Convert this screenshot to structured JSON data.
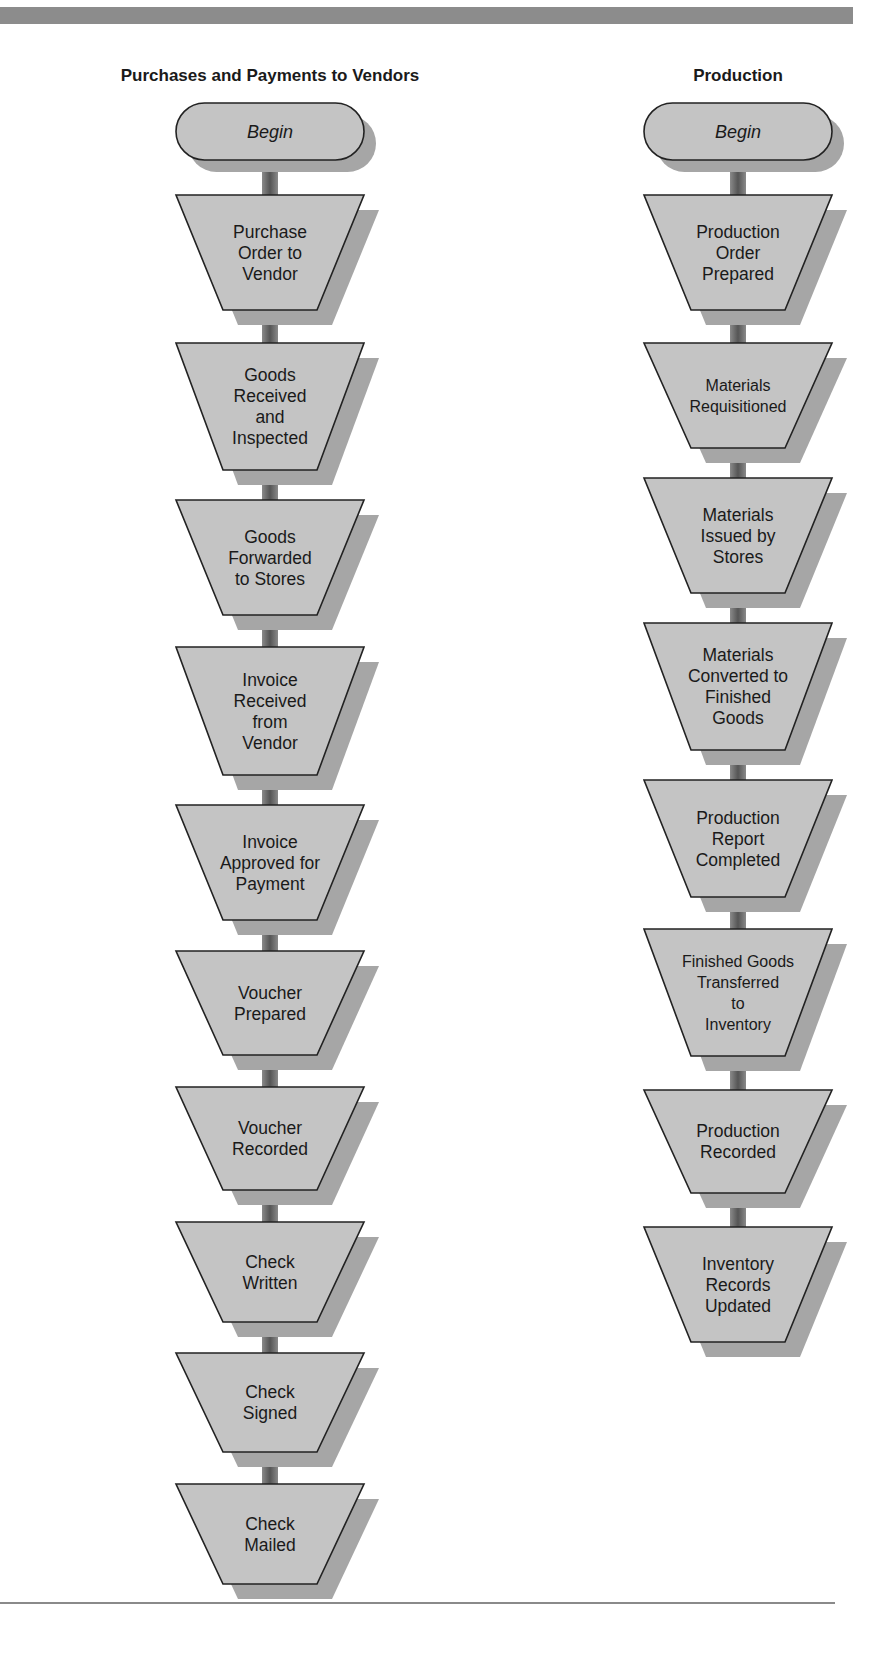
{
  "header": {
    "bar_color": "#8c8c8c"
  },
  "columns": [
    {
      "id": "purchases",
      "title": "Purchases and Payments to Vendors",
      "center_x": 270,
      "steps": [
        {
          "type": "terminal",
          "label": "Begin",
          "lines": [
            "Begin"
          ],
          "top": 103,
          "bottom": 160
        },
        {
          "type": "manual",
          "label": "Purchase Order to Vendor",
          "lines": [
            "Purchase",
            "Order to",
            "Vendor"
          ],
          "top": 195,
          "bottom": 310
        },
        {
          "type": "manual",
          "label": "Goods Received and Inspected",
          "lines": [
            "Goods",
            "Received",
            "and",
            "Inspected"
          ],
          "top": 343,
          "bottom": 470
        },
        {
          "type": "manual",
          "label": "Goods Forwarded to Stores",
          "lines": [
            "Goods",
            "Forwarded",
            "to Stores"
          ],
          "top": 500,
          "bottom": 615
        },
        {
          "type": "manual",
          "label": "Invoice Received from Vendor",
          "lines": [
            "Invoice",
            "Received",
            "from",
            "Vendor"
          ],
          "top": 647,
          "bottom": 775
        },
        {
          "type": "manual",
          "label": "Invoice Approved for Payment",
          "lines": [
            "Invoice",
            "Approved for",
            "Payment"
          ],
          "top": 805,
          "bottom": 920
        },
        {
          "type": "manual",
          "label": "Voucher Prepared",
          "lines": [
            "Voucher",
            "Prepared"
          ],
          "top": 951,
          "bottom": 1055
        },
        {
          "type": "manual",
          "label": "Voucher Recorded",
          "lines": [
            "Voucher",
            "Recorded"
          ],
          "top": 1087,
          "bottom": 1190
        },
        {
          "type": "manual",
          "label": "Check Written",
          "lines": [
            "Check",
            "Written"
          ],
          "top": 1222,
          "bottom": 1322
        },
        {
          "type": "manual",
          "label": "Check Signed",
          "lines": [
            "Check",
            "Signed"
          ],
          "top": 1353,
          "bottom": 1452
        },
        {
          "type": "manual",
          "label": "Check Mailed",
          "lines": [
            "Check",
            "Mailed"
          ],
          "top": 1484,
          "bottom": 1584
        }
      ]
    },
    {
      "id": "production",
      "title": "Production",
      "center_x": 738,
      "steps": [
        {
          "type": "terminal",
          "label": "Begin",
          "lines": [
            "Begin"
          ],
          "top": 103,
          "bottom": 160
        },
        {
          "type": "manual",
          "label": "Production Order Prepared",
          "lines": [
            "Production",
            "Order",
            "Prepared"
          ],
          "top": 195,
          "bottom": 310
        },
        {
          "type": "manual",
          "label": "Materials Requisitioned",
          "lines": [
            "Materials",
            "Requisitioned"
          ],
          "top": 343,
          "bottom": 448
        },
        {
          "type": "manual",
          "label": "Materials Issued by Stores",
          "lines": [
            "Materials",
            "Issued by",
            "Stores"
          ],
          "top": 478,
          "bottom": 593
        },
        {
          "type": "manual",
          "label": "Materials Converted to Finished Goods",
          "lines": [
            "Materials",
            "Converted to",
            "Finished",
            "Goods"
          ],
          "top": 623,
          "bottom": 750
        },
        {
          "type": "manual",
          "label": "Production Report Completed",
          "lines": [
            "Production",
            "Report",
            "Completed"
          ],
          "top": 780,
          "bottom": 897
        },
        {
          "type": "manual",
          "label": "Finished Goods Transferred to Inventory",
          "lines": [
            "Finished Goods",
            "Transferred",
            "to",
            "Inventory"
          ],
          "top": 929,
          "bottom": 1056
        },
        {
          "type": "manual",
          "label": "Production Recorded",
          "lines": [
            "Production",
            "Recorded"
          ],
          "top": 1090,
          "bottom": 1193
        },
        {
          "type": "manual",
          "label": "Inventory Records Updated",
          "lines": [
            "Inventory",
            "Records",
            "Updated"
          ],
          "top": 1227,
          "bottom": 1342
        }
      ]
    }
  ],
  "style": {
    "shape_fill": "#c4c4c4",
    "shape_stroke": "#222222",
    "shadow_fill": "#a6a6a6",
    "connector_fill": "#6e6e6e"
  }
}
